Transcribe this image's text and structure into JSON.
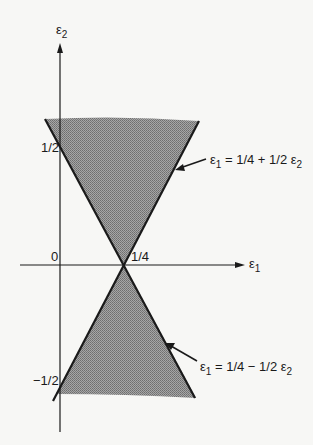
{
  "diagram": {
    "title": "",
    "axes": {
      "x": {
        "label": "ε",
        "label_sub": "1"
      },
      "y": {
        "label": "ε",
        "label_sub": "2"
      }
    },
    "ticks": {
      "origin": "0",
      "x_quarter": "1/4",
      "y_half": "1/2",
      "y_neg_half": "−1/2"
    },
    "lines": [
      {
        "name": "upper-boundary",
        "eq_lhs": "ε",
        "eq_lhs_sub": "1",
        "eq_rhs_a": " = 1/4 + 1/2 ε",
        "eq_rhs_sub": "2"
      },
      {
        "name": "lower-boundary",
        "eq_lhs": "ε",
        "eq_lhs_sub": "1",
        "eq_rhs_a": " = 1/4 − 1/2 ε",
        "eq_rhs_sub": "2"
      }
    ],
    "colors": {
      "ink": "#1a1a1a",
      "shade": "#8e8e8e",
      "background": "#f7f7f5"
    }
  }
}
